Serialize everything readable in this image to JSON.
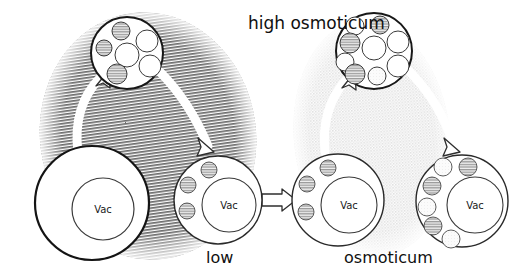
{
  "figure": {
    "width": 528,
    "height": 276,
    "background": "#ffffff"
  },
  "labels": {
    "high_osmoticum": "high osmoticum",
    "low": "low",
    "osmoticum": "osmoticum",
    "vacuole": "Vac"
  },
  "colors": {
    "ink": "#101010",
    "outline": "#2a2a2a",
    "hatch_dark": "#5a5a5a",
    "shade_light": "#e8e8e8",
    "vesicle_hatch": "#9a9a9a",
    "vesicle_clear": "#f2f2f2",
    "arrow_fill": "#ffffff",
    "cell_fill": "#ffffff"
  },
  "regions": [
    {
      "name": "high-osmoticum-region",
      "texture": "dense-horizontal-hatch",
      "cx": 148,
      "cy": 136,
      "rx": 108,
      "ry": 124,
      "rotate": -8
    },
    {
      "name": "osmoticum-region",
      "texture": "light-dotted-shade",
      "cx": 372,
      "cy": 138,
      "rx": 78,
      "ry": 118,
      "rotate": -6
    }
  ],
  "cells": [
    {
      "name": "cell-turgid-high-osmoticum",
      "cx": 92,
      "cy": 203,
      "r": 57,
      "vac_cx": 103,
      "vac_cy": 209,
      "vac_r": 31,
      "vac_label": "Vac",
      "vesicles": []
    },
    {
      "name": "cell-plasmolysed-low",
      "cx": 218,
      "cy": 200,
      "r": 44,
      "vac_cx": 229,
      "vac_cy": 205,
      "vac_r": 27,
      "vac_label": "Vac",
      "vesicles": [
        {
          "cx": 209,
          "cy": 170,
          "r": 8,
          "fill": "hatched"
        },
        {
          "cx": 188,
          "cy": 185,
          "r": 8,
          "fill": "hatched"
        },
        {
          "cx": 187,
          "cy": 211,
          "r": 8,
          "fill": "hatched"
        }
      ]
    },
    {
      "name": "cell-plasmolysed-osmoticum",
      "cx": 338,
      "cy": 200,
      "r": 46,
      "vac_cx": 349,
      "vac_cy": 205,
      "vac_r": 28,
      "vac_label": "Vac",
      "vesicles": [
        {
          "cx": 328,
          "cy": 168,
          "r": 8,
          "fill": "hatched"
        },
        {
          "cx": 307,
          "cy": 184,
          "r": 8,
          "fill": "hatched"
        },
        {
          "cx": 306,
          "cy": 212,
          "r": 8,
          "fill": "hatched"
        }
      ]
    },
    {
      "name": "cell-vesiculated-osmoticum",
      "cx": 462,
      "cy": 201,
      "r": 46,
      "vac_cx": 475,
      "vac_cy": 205,
      "vac_r": 28,
      "vac_label": "Vac",
      "vesicles": [
        {
          "cx": 468,
          "cy": 167,
          "r": 9,
          "fill": "hatched"
        },
        {
          "cx": 443,
          "cy": 167,
          "r": 9,
          "fill": "clear"
        },
        {
          "cx": 432,
          "cy": 186,
          "r": 9,
          "fill": "hatched"
        },
        {
          "cx": 427,
          "cy": 207,
          "r": 9,
          "fill": "clear"
        },
        {
          "cx": 433,
          "cy": 226,
          "r": 9,
          "fill": "hatched"
        },
        {
          "cx": 451,
          "cy": 239,
          "r": 9,
          "fill": "clear"
        }
      ]
    }
  ],
  "insets": [
    {
      "name": "inset-membrane-high-osmoticum",
      "cx": 127,
      "cy": 53,
      "r": 36,
      "vesicles": [
        {
          "cx": 121,
          "cy": 31,
          "r": 9,
          "fill": "hatched"
        },
        {
          "cx": 147,
          "cy": 41,
          "r": 11,
          "fill": "clear"
        },
        {
          "cx": 104,
          "cy": 48,
          "r": 8,
          "fill": "hatched"
        },
        {
          "cx": 127,
          "cy": 55,
          "r": 12,
          "fill": "clear"
        },
        {
          "cx": 150,
          "cy": 66,
          "r": 11,
          "fill": "clear"
        },
        {
          "cx": 117,
          "cy": 74,
          "r": 10,
          "fill": "hatched"
        }
      ]
    },
    {
      "name": "inset-membrane-osmoticum",
      "cx": 374,
      "cy": 51,
      "r": 38,
      "vesicles": [
        {
          "cx": 355,
          "cy": 26,
          "r": 9,
          "fill": "clear"
        },
        {
          "cx": 380,
          "cy": 25,
          "r": 9,
          "fill": "hatched"
        },
        {
          "cx": 350,
          "cy": 43,
          "r": 10,
          "fill": "hatched"
        },
        {
          "cx": 374,
          "cy": 48,
          "r": 12,
          "fill": "clear"
        },
        {
          "cx": 398,
          "cy": 42,
          "r": 11,
          "fill": "clear"
        },
        {
          "cx": 345,
          "cy": 62,
          "r": 9,
          "fill": "clear"
        },
        {
          "cx": 398,
          "cy": 66,
          "r": 11,
          "fill": "clear"
        },
        {
          "cx": 355,
          "cy": 74,
          "r": 10,
          "fill": "hatched"
        },
        {
          "cx": 377,
          "cy": 76,
          "r": 9,
          "fill": "hatched"
        }
      ]
    }
  ],
  "arrows": [
    {
      "name": "arrow-cell1-to-inset1",
      "type": "curved-outline",
      "direction": "up"
    },
    {
      "name": "arrow-inset1-to-cell2",
      "type": "curved-outline",
      "direction": "down-right"
    },
    {
      "name": "arrow-cell2-to-cell3",
      "type": "straight-outline",
      "direction": "right"
    },
    {
      "name": "arrow-cell3-to-inset2",
      "type": "curved-outline",
      "direction": "up"
    },
    {
      "name": "arrow-inset2-to-cell4",
      "type": "curved-outline",
      "direction": "down-right"
    }
  ]
}
